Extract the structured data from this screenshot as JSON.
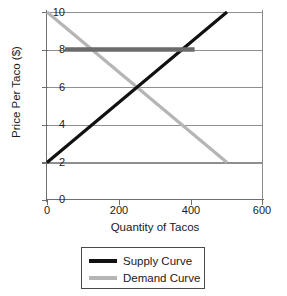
{
  "chart_data": {
    "type": "line",
    "title": "",
    "xlabel": "Quantity of Tacos",
    "ylabel": "Price Per Taco ($)",
    "xlim": [
      0,
      600
    ],
    "ylim": [
      0,
      10
    ],
    "xticks": [
      0,
      200,
      400,
      600
    ],
    "yticks": [
      0,
      2,
      4,
      6,
      8,
      10
    ],
    "xtick_labels": [
      "0",
      "200",
      "400",
      "600"
    ],
    "ytick_labels": [
      "0",
      "2",
      "4",
      "6",
      "8",
      "10"
    ],
    "grid": "horizontal",
    "legend_position": "below-center",
    "series": [
      {
        "name": "Supply Curve",
        "color": "#111111",
        "x": [
          0,
          500
        ],
        "y": [
          2,
          10
        ],
        "linewidth": 3.2
      },
      {
        "name": "Demand Curve",
        "color": "#b5b5b5",
        "x": [
          0,
          500
        ],
        "y": [
          10,
          2
        ],
        "linewidth": 3.2
      }
    ],
    "annotations": [
      {
        "name": "price-ceiling-bar",
        "type": "horizontal-bar",
        "y": 8,
        "x_start": 50,
        "x_end": 410,
        "color": "#6b6b6b",
        "linewidth": 4.5
      }
    ],
    "equilibrium": {
      "quantity": 250,
      "price": 6
    }
  },
  "axes": {
    "y_title": "Price Per Taco ($)",
    "x_title": "Quantity of Tacos",
    "y_tick_labels": [
      "10",
      "8",
      "6",
      "4",
      "2",
      "0"
    ],
    "x_tick_labels": [
      "0",
      "200",
      "400",
      "600"
    ]
  },
  "legend": {
    "items": [
      {
        "label": "Supply Curve",
        "color": "#111111"
      },
      {
        "label": "Demand Curve",
        "color": "#b5b5b5"
      }
    ]
  },
  "colors": {
    "supply": "#111111",
    "demand": "#b5b5b5",
    "gridline": "#8f8f8f",
    "axis": "#6e6e6e",
    "bar": "#6b6b6b",
    "background": "#ffffff",
    "text": "#1a1a1a"
  }
}
